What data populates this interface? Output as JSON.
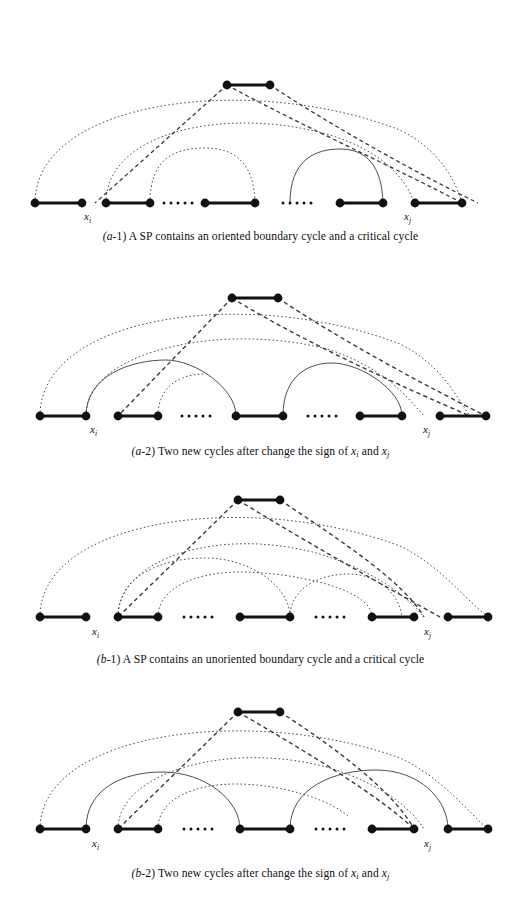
{
  "figure": {
    "type": "graph-diagram",
    "colors": {
      "node": "#111111",
      "edge": "#111111",
      "arc": "#3a3a3a",
      "background": "#ffffff",
      "text": "#111111"
    },
    "styles": {
      "solid": "solid arc",
      "dotted": "dotted arc",
      "dashed": "dashed arc"
    }
  },
  "panels": [
    {
      "id": "a-1",
      "caption_prefix": "(a-1)",
      "caption_text": "A SP contains an oriented boundary cycle and a critical cycle",
      "labels": {
        "left": "x",
        "left_sub": "i",
        "right": "x",
        "right_sub": "j"
      },
      "baseline_pairs": 5,
      "top_pair": 1,
      "ellipses": 2,
      "arcs": 7
    },
    {
      "id": "a-2",
      "caption_prefix": "(a-2)",
      "caption_text": "Two new cycles after change the sign of",
      "caption_tail": "and",
      "labels": {
        "left": "x",
        "left_sub": "i",
        "right": "x",
        "right_sub": "j"
      },
      "baseline_pairs": 5,
      "top_pair": 1,
      "ellipses": 2,
      "arcs": 7
    },
    {
      "id": "b-1",
      "caption_prefix": "(b-1)",
      "caption_text": "A SP contains an unoriented boundary cycle and a critical cycle",
      "labels": {
        "left": "x",
        "left_sub": "i",
        "right": "x",
        "right_sub": "j"
      },
      "baseline_pairs": 5,
      "top_pair": 1,
      "ellipses": 2,
      "arcs": 7
    },
    {
      "id": "b-2",
      "caption_prefix": "(b-2)",
      "caption_text": "Two new cycles after change the sign of",
      "caption_tail": "and",
      "labels": {
        "left": "x",
        "left_sub": "i",
        "right": "x",
        "right_sub": "j"
      },
      "baseline_pairs": 5,
      "top_pair": 1,
      "ellipses": 2,
      "arcs": 7
    }
  ],
  "captions": {
    "a1": "(a-1) A SP contains an oriented boundary cycle and a critical cycle",
    "a2_head": "(a-2) Two new cycles after change the sign of ",
    "a2_mid": " and ",
    "b1": "(b-1) A SP contains an unoriented boundary cycle and a critical cycle",
    "b2_head": "(b-2) Two new cycles after change the sign of ",
    "b2_mid": " and "
  },
  "caption_parts": {
    "a1_prefix": "(a",
    "a1_suffix": "-1) A SP contains an oriented boundary cycle and a critical cycle",
    "a2_prefix": "(a",
    "a2_suffix": "-2) Two new cycles after change the sign of ",
    "b1_prefix": "(b",
    "b1_suffix": "-1) A SP contains an unoriented boundary cycle and a critical cycle",
    "b2_prefix": "(b",
    "b2_suffix": "-2) Two new cycles after change the sign of ",
    "and": " and ",
    "x": "x",
    "i": "i",
    "j": "j"
  }
}
